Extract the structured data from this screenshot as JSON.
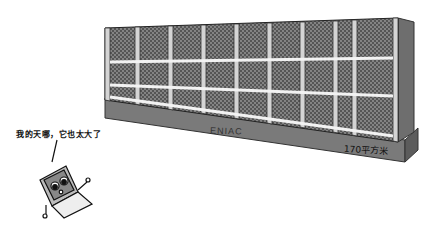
{
  "illustration": {
    "machine": {
      "name": "ENIAC",
      "area_label": "170平方米",
      "cabinet_count": 9,
      "colors": {
        "panel": "#5a5a5a",
        "frame": "#c8c8c8",
        "base": "#777777",
        "side": "#6a6a6a",
        "stripe": "#f4f4f4"
      }
    },
    "laptop": {
      "speech_text": "我的天哪，它也太大了"
    }
  }
}
